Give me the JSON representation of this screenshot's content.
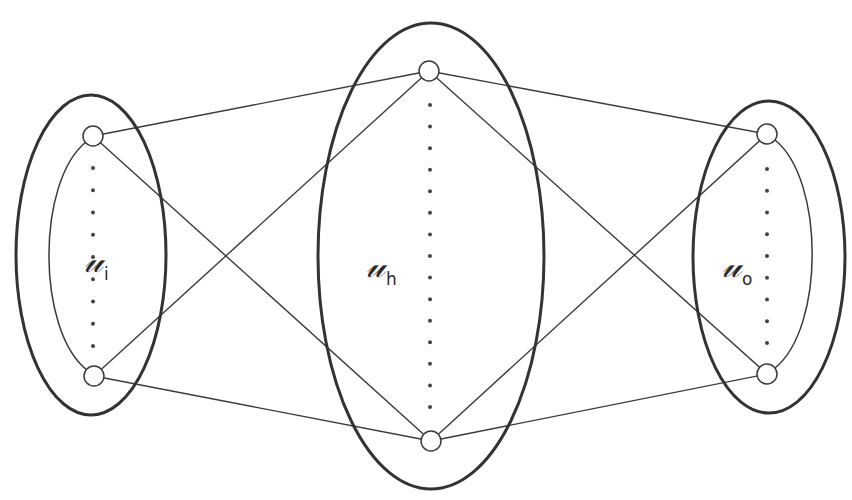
{
  "diagram": {
    "colors": {
      "stroke": "#3a3a3a",
      "thick_stroke": "#333333",
      "node_fill": "#ffffff",
      "dot": "#444444"
    },
    "layers": [
      {
        "id": "input",
        "symbol": "𝓊",
        "subscript": "i",
        "label_x": 84,
        "label_y": 240,
        "outer": {
          "cx": 91,
          "cy": 255,
          "rx": 75,
          "ry": 160
        },
        "inner_arc": {
          "x1": 86,
          "y1": 142,
          "x2": 87,
          "y2": 370,
          "side": "left",
          "extreme_x": 49
        },
        "nodes": [
          {
            "x": 93,
            "y": 136
          },
          {
            "x": 94,
            "y": 376
          }
        ],
        "dot_x": 93,
        "dot_y_start": 168,
        "dot_y_end": 346,
        "dot_count": 9
      },
      {
        "id": "hidden",
        "symbol": "𝓊",
        "subscript": "h",
        "label_x": 366,
        "label_y": 245,
        "outer": {
          "cx": 431,
          "cy": 256,
          "rx": 113,
          "ry": 233
        },
        "nodes": [
          {
            "x": 429,
            "y": 71
          },
          {
            "x": 431,
            "y": 441
          }
        ],
        "dot_x": 430,
        "dot_y_start": 105,
        "dot_y_end": 407,
        "dot_count": 15
      },
      {
        "id": "output",
        "symbol": "𝓊",
        "subscript": "o",
        "label_x": 722,
        "label_y": 245,
        "outer": {
          "cx": 769,
          "cy": 257,
          "rx": 76,
          "ry": 156
        },
        "inner_arc": {
          "x1": 775,
          "y1": 140,
          "x2": 775,
          "y2": 368,
          "side": "right",
          "extreme_x": 812
        },
        "nodes": [
          {
            "x": 767,
            "y": 134
          },
          {
            "x": 767,
            "y": 374
          }
        ],
        "dot_x": 767,
        "dot_y_start": 169,
        "dot_y_end": 343,
        "dot_count": 9
      }
    ],
    "node_radius": 10,
    "edges": [
      [
        0,
        0,
        1,
        0
      ],
      [
        0,
        0,
        1,
        1
      ],
      [
        0,
        1,
        1,
        0
      ],
      [
        0,
        1,
        1,
        1
      ],
      [
        1,
        0,
        2,
        0
      ],
      [
        1,
        0,
        2,
        1
      ],
      [
        1,
        1,
        2,
        0
      ],
      [
        1,
        1,
        2,
        1
      ]
    ]
  }
}
